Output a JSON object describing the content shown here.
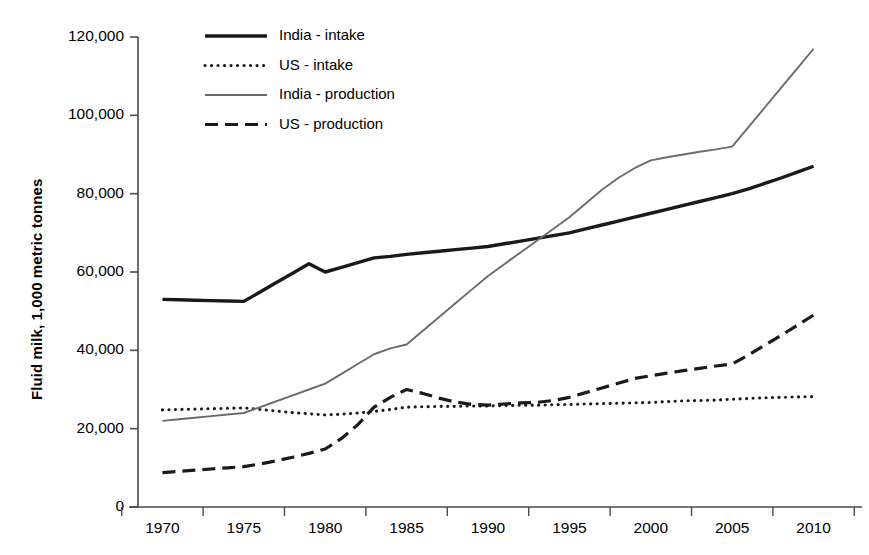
{
  "chart_data": {
    "type": "line",
    "title": "",
    "xlabel": "",
    "ylabel": "Fluid milk, 1,000 metric tonnes",
    "xlim": [
      1968.5,
      2011.5
    ],
    "ylim": [
      0,
      120000
    ],
    "grid": false,
    "legend_position": "top-center-left",
    "x_tick_labels": [
      "1970",
      "1975",
      "1980",
      "1985",
      "1990",
      "1995",
      "2000",
      "2005",
      "2010"
    ],
    "x_ticks": [
      1970,
      1975,
      1980,
      1985,
      1990,
      1995,
      2000,
      2005,
      2010
    ],
    "y_tick_labels": [
      "0",
      "20,000",
      "40,000",
      "60,000",
      "80,000",
      "100,000",
      "120,000"
    ],
    "y_ticks": [
      0,
      20000,
      40000,
      60000,
      80000,
      100000,
      120000
    ],
    "x": [
      1970,
      1971,
      1972,
      1973,
      1974,
      1975,
      1976,
      1977,
      1978,
      1979,
      1980,
      1981,
      1982,
      1983,
      1984,
      1985,
      1986,
      1987,
      1988,
      1989,
      1990,
      1991,
      1992,
      1993,
      1994,
      1995,
      1996,
      1997,
      1998,
      1999,
      2000,
      2001,
      2002,
      2003,
      2004,
      2005,
      2006,
      2007,
      2008,
      2009,
      2010
    ],
    "series": [
      {
        "name": "India - intake",
        "style": "solid-thick",
        "color": "#1a1a1a",
        "values": [
          53000,
          52900,
          52800,
          52700,
          52600,
          52500,
          54900,
          57300,
          59700,
          62100,
          60000,
          61200,
          62400,
          63600,
          64000,
          64500,
          64900,
          65300,
          65700,
          66100,
          66500,
          67200,
          67900,
          68600,
          69300,
          70000,
          71000,
          72000,
          73000,
          74000,
          75000,
          76000,
          77000,
          78000,
          79000,
          80000,
          81200,
          82600,
          84000,
          85500,
          87000
        ]
      },
      {
        "name": "US - intake",
        "style": "dotted",
        "color": "#1a1a1a",
        "values": [
          24800,
          24900,
          25000,
          25100,
          25200,
          25300,
          24900,
          24500,
          24100,
          23800,
          23500,
          23700,
          24000,
          24400,
          24900,
          25500,
          25600,
          25700,
          25700,
          25800,
          25800,
          25900,
          26000,
          26000,
          26100,
          26200,
          26300,
          26400,
          26500,
          26600,
          26700,
          26900,
          27100,
          27200,
          27300,
          27500,
          27700,
          27900,
          28000,
          28100,
          28200
        ]
      },
      {
        "name": "India - production",
        "style": "solid-thin",
        "color": "#6b6b6b",
        "values": [
          22000,
          22400,
          22800,
          23200,
          23600,
          24000,
          25500,
          27000,
          28500,
          30000,
          31500,
          34000,
          36500,
          39000,
          40500,
          41500,
          45000,
          48500,
          52000,
          55500,
          59000,
          62000,
          65000,
          68000,
          71000,
          74000,
          77500,
          81000,
          84000,
          86500,
          88500,
          89300,
          90000,
          90700,
          91300,
          92000,
          97000,
          102000,
          107000,
          112000,
          117000
        ]
      },
      {
        "name": "US - production",
        "style": "dashed",
        "color": "#1a1a1a",
        "values": [
          8800,
          9100,
          9400,
          9700,
          10000,
          10300,
          11000,
          11800,
          12700,
          13700,
          14800,
          17500,
          21000,
          25500,
          28000,
          30000,
          29000,
          27800,
          26800,
          26200,
          26000,
          26300,
          26600,
          26700,
          27200,
          28000,
          29200,
          30400,
          31600,
          32800,
          33500,
          34200,
          34800,
          35400,
          36000,
          36500,
          38800,
          41300,
          43800,
          46400,
          49000
        ]
      }
    ]
  },
  "legend": {
    "items": [
      {
        "label": "India - intake",
        "style": "solid-thick"
      },
      {
        "label": "US - intake",
        "style": "dotted"
      },
      {
        "label": "India - production",
        "style": "solid-thin"
      },
      {
        "label": "US - production",
        "style": "dashed"
      }
    ]
  }
}
